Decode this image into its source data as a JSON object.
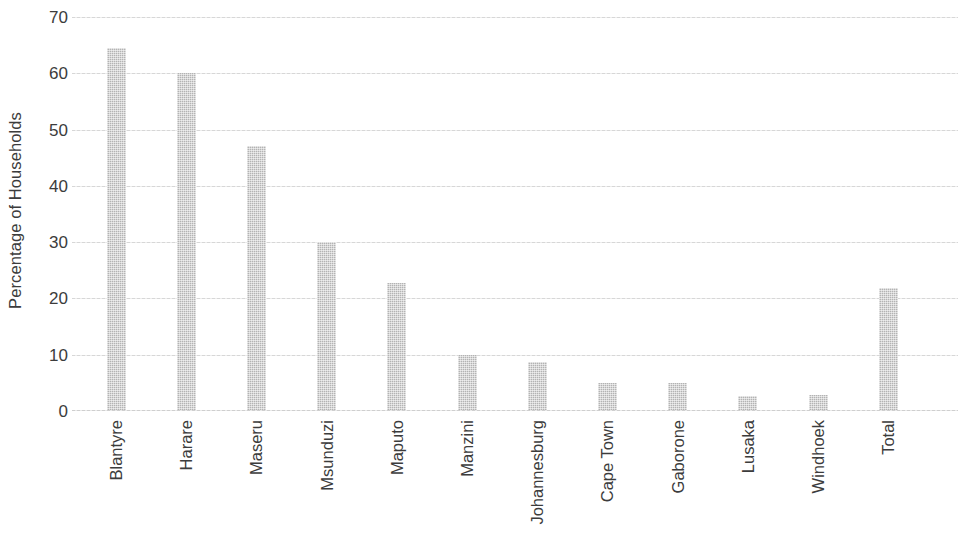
{
  "chart_data": {
    "type": "bar",
    "title": "",
    "subtitle": "",
    "xlabel": "",
    "ylabel": "Percentage of Households",
    "ylim": [
      0,
      70
    ],
    "yticks": [
      0,
      10,
      20,
      30,
      40,
      50,
      60,
      70
    ],
    "ytick_labels": [
      "0",
      "10",
      "20",
      "30",
      "40",
      "50",
      "60",
      "70"
    ],
    "grid": true,
    "legend": null,
    "bar_color": "#bdbdbd",
    "text_color": "#3c3c3c",
    "gridline_color": "#dcdcdc",
    "categories": [
      "Blantyre",
      "Harare",
      "Maseru",
      "Msunduzi",
      "Maputo",
      "Manzini",
      "Johannesburg",
      "Cape Town",
      "Gaborone",
      "Lusaka",
      "Windhoek",
      "Total"
    ],
    "values": [
      64.5,
      60.0,
      47.0,
      30.0,
      22.7,
      10.0,
      8.7,
      5.0,
      5.0,
      2.7,
      2.8,
      21.8
    ]
  }
}
